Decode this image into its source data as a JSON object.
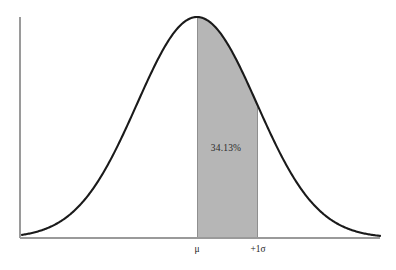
{
  "chart_data": {
    "type": "area",
    "title": "",
    "subtitle": "",
    "xlabel": "",
    "ylabel": "",
    "grid": false,
    "legend": false,
    "distribution": "normal",
    "curve": {
      "mean_label": "μ",
      "mean_x_px": 197,
      "sigma_px": 60,
      "peak_y_px": 17,
      "baseline_y_px": 238,
      "x_start_px": 22,
      "x_end_px": 380
    },
    "axes": {
      "y_axis_x_px": 20,
      "y_axis_top_px": 17,
      "y_axis_bottom_px": 238,
      "x_axis_y_px": 238,
      "x_axis_left_px": 20,
      "x_axis_right_px": 380,
      "axis_color": "#9a9a9a"
    },
    "shaded_regions": [
      {
        "label": "34.13%",
        "value": 34.13,
        "from": "μ",
        "to": "+1σ",
        "from_sigma": 0,
        "to_sigma": 1,
        "fill_color": "#b6b6b6",
        "label_x_px": 226,
        "label_y_px": 148
      }
    ],
    "ticks": [
      {
        "label": "μ",
        "x_px": 197,
        "sigma": 0
      },
      {
        "label": "+1σ",
        "x_px": 258,
        "sigma": 1
      }
    ],
    "colors": {
      "background": "#ffffff",
      "curve_stroke": "#1a1a1a",
      "shade_fill": "#b6b6b6",
      "axis": "#9a9a9a",
      "text": "#1f1f1f"
    }
  }
}
